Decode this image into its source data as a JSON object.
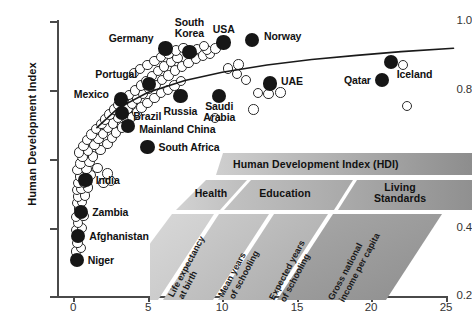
{
  "chart_data": {
    "type": "scatter",
    "title": "",
    "xlabel": "",
    "ylabel": "Human Development Index",
    "xlim": [
      -1.2,
      26
    ],
    "ylim": [
      0.2,
      1.02
    ],
    "xticks": [
      "0",
      "5",
      "10",
      "15",
      "20",
      "25"
    ],
    "xtick_values": [
      0,
      5,
      10,
      15,
      20,
      25
    ],
    "yticks": [
      "1.0",
      "0.8",
      "0.6",
      "0.4",
      "0.2"
    ],
    "ytick_values": [
      1.0,
      0.8,
      0.6,
      0.4,
      0.2
    ],
    "grid": false,
    "legend": "none",
    "series": [
      {
        "name": "Labelled countries",
        "marker": "filled circle",
        "color": "#161616",
        "points": [
          {
            "label": "Germany",
            "x": 6.2,
            "y": 0.92,
            "label_pos": "left"
          },
          {
            "label": "South Korea",
            "x": 7.8,
            "y": 0.909,
            "label_pos": "top"
          },
          {
            "label": "USA",
            "x": 10.1,
            "y": 0.937,
            "label_pos": "top"
          },
          {
            "label": "Norway",
            "x": 12.0,
            "y": 0.944,
            "label_pos": "right"
          },
          {
            "label": "Portugal",
            "x": 5.1,
            "y": 0.816,
            "label_pos": "left"
          },
          {
            "label": "Mexico",
            "x": 3.2,
            "y": 0.772,
            "label_pos": "left"
          },
          {
            "label": "Brazil",
            "x": 3.3,
            "y": 0.733,
            "label_pos": "right"
          },
          {
            "label": "Mainland China",
            "x": 3.7,
            "y": 0.694,
            "label_pos": "right"
          },
          {
            "label": "South Africa",
            "x": 5.0,
            "y": 0.634,
            "label_pos": "right"
          },
          {
            "label": "Russia",
            "x": 7.2,
            "y": 0.782,
            "label_pos": "bottom"
          },
          {
            "label": "Saudi Arabia",
            "x": 9.8,
            "y": 0.782,
            "label_pos": "bottom"
          },
          {
            "label": "UAE",
            "x": 13.2,
            "y": 0.818,
            "label_pos": "right"
          },
          {
            "label": "Qatar",
            "x": 20.7,
            "y": 0.829,
            "label_pos": "left"
          },
          {
            "label": "Iceland",
            "x": 21.3,
            "y": 0.88,
            "label_pos": "bottom"
          },
          {
            "label": "India",
            "x": 0.85,
            "y": 0.537,
            "label_pos": "right"
          },
          {
            "label": "Zambia",
            "x": 0.55,
            "y": 0.445,
            "label_pos": "right"
          },
          {
            "label": "Afghanistan",
            "x": 0.35,
            "y": 0.374,
            "label_pos": "right"
          },
          {
            "label": "Niger",
            "x": 0.25,
            "y": 0.305,
            "label_pos": "right"
          }
        ]
      },
      {
        "name": "Other countries",
        "marker": "open circle",
        "color": "#ffffff",
        "edge_color": "#2b2b2b",
        "points": [
          {
            "x": 0.2,
            "y": 0.33
          },
          {
            "x": 0.55,
            "y": 0.34
          },
          {
            "x": 0.3,
            "y": 0.355
          },
          {
            "x": 0.2,
            "y": 0.392
          },
          {
            "x": 0.6,
            "y": 0.398
          },
          {
            "x": 0.35,
            "y": 0.412
          },
          {
            "x": 0.22,
            "y": 0.43
          },
          {
            "x": 0.7,
            "y": 0.432
          },
          {
            "x": 0.4,
            "y": 0.455
          },
          {
            "x": 0.25,
            "y": 0.47
          },
          {
            "x": 0.62,
            "y": 0.474
          },
          {
            "x": 0.35,
            "y": 0.49
          },
          {
            "x": 0.82,
            "y": 0.492
          },
          {
            "x": 0.28,
            "y": 0.508
          },
          {
            "x": 0.58,
            "y": 0.512
          },
          {
            "x": 1.0,
            "y": 0.516
          },
          {
            "x": 0.38,
            "y": 0.528
          },
          {
            "x": 0.75,
            "y": 0.53
          },
          {
            "x": 2.05,
            "y": 0.528
          },
          {
            "x": 2.55,
            "y": 0.534
          },
          {
            "x": 0.45,
            "y": 0.548
          },
          {
            "x": 1.2,
            "y": 0.552
          },
          {
            "x": 2.3,
            "y": 0.556
          },
          {
            "x": 0.3,
            "y": 0.566
          },
          {
            "x": 0.9,
            "y": 0.57
          },
          {
            "x": 1.65,
            "y": 0.572
          },
          {
            "x": 0.5,
            "y": 0.585
          },
          {
            "x": 1.1,
            "y": 0.59
          },
          {
            "x": 0.65,
            "y": 0.604
          },
          {
            "x": 1.35,
            "y": 0.606
          },
          {
            "x": 0.4,
            "y": 0.618
          },
          {
            "x": 1.0,
            "y": 0.622
          },
          {
            "x": 1.85,
            "y": 0.624
          },
          {
            "x": 0.7,
            "y": 0.636
          },
          {
            "x": 1.45,
            "y": 0.64
          },
          {
            "x": 2.3,
            "y": 0.642
          },
          {
            "x": 0.95,
            "y": 0.654
          },
          {
            "x": 1.7,
            "y": 0.656
          },
          {
            "x": 2.6,
            "y": 0.66
          },
          {
            "x": 1.25,
            "y": 0.67
          },
          {
            "x": 2.0,
            "y": 0.672
          },
          {
            "x": 2.9,
            "y": 0.676
          },
          {
            "x": 1.55,
            "y": 0.686
          },
          {
            "x": 2.35,
            "y": 0.688
          },
          {
            "x": 3.3,
            "y": 0.69
          },
          {
            "x": 1.9,
            "y": 0.7
          },
          {
            "x": 2.7,
            "y": 0.702
          },
          {
            "x": 3.6,
            "y": 0.706
          },
          {
            "x": 2.15,
            "y": 0.714
          },
          {
            "x": 3.0,
            "y": 0.718
          },
          {
            "x": 3.95,
            "y": 0.72
          },
          {
            "x": 2.45,
            "y": 0.728
          },
          {
            "x": 3.35,
            "y": 0.732
          },
          {
            "x": 4.3,
            "y": 0.734
          },
          {
            "x": 2.75,
            "y": 0.742
          },
          {
            "x": 3.65,
            "y": 0.746
          },
          {
            "x": 4.6,
            "y": 0.748
          },
          {
            "x": 3.05,
            "y": 0.756
          },
          {
            "x": 3.95,
            "y": 0.76
          },
          {
            "x": 5.0,
            "y": 0.762
          },
          {
            "x": 3.4,
            "y": 0.77
          },
          {
            "x": 4.3,
            "y": 0.774
          },
          {
            "x": 5.45,
            "y": 0.776
          },
          {
            "x": 3.75,
            "y": 0.784
          },
          {
            "x": 4.7,
            "y": 0.788
          },
          {
            "x": 5.9,
            "y": 0.79
          },
          {
            "x": 4.15,
            "y": 0.798
          },
          {
            "x": 5.1,
            "y": 0.802
          },
          {
            "x": 6.35,
            "y": 0.8
          },
          {
            "x": 4.55,
            "y": 0.812
          },
          {
            "x": 5.55,
            "y": 0.814
          },
          {
            "x": 6.8,
            "y": 0.812
          },
          {
            "x": 4.9,
            "y": 0.826
          },
          {
            "x": 5.95,
            "y": 0.828
          },
          {
            "x": 7.25,
            "y": 0.826
          },
          {
            "x": 5.3,
            "y": 0.84
          },
          {
            "x": 6.4,
            "y": 0.842
          },
          {
            "x": 4.1,
            "y": 0.848
          },
          {
            "x": 5.7,
            "y": 0.854
          },
          {
            "x": 6.85,
            "y": 0.856
          },
          {
            "x": 4.5,
            "y": 0.86
          },
          {
            "x": 6.1,
            "y": 0.868
          },
          {
            "x": 7.3,
            "y": 0.868
          },
          {
            "x": 5.0,
            "y": 0.872
          },
          {
            "x": 6.55,
            "y": 0.88
          },
          {
            "x": 7.75,
            "y": 0.878
          },
          {
            "x": 5.45,
            "y": 0.884
          },
          {
            "x": 7.0,
            "y": 0.892
          },
          {
            "x": 8.25,
            "y": 0.89
          },
          {
            "x": 5.9,
            "y": 0.896
          },
          {
            "x": 8.7,
            "y": 0.9
          },
          {
            "x": 9.2,
            "y": 0.906
          },
          {
            "x": 6.4,
            "y": 0.906
          },
          {
            "x": 9.0,
            "y": 0.916
          },
          {
            "x": 9.55,
            "y": 0.92
          },
          {
            "x": 6.9,
            "y": 0.914
          },
          {
            "x": 7.4,
            "y": 0.922
          },
          {
            "x": 8.3,
            "y": 0.918
          },
          {
            "x": 8.8,
            "y": 0.928
          },
          {
            "x": 10.4,
            "y": 0.862
          },
          {
            "x": 11.0,
            "y": 0.845
          },
          {
            "x": 11.6,
            "y": 0.828
          },
          {
            "x": 11.1,
            "y": 0.874
          },
          {
            "x": 12.4,
            "y": 0.79
          },
          {
            "x": 13.1,
            "y": 0.788
          },
          {
            "x": 13.9,
            "y": 0.792
          },
          {
            "x": 22.1,
            "y": 0.872
          },
          {
            "x": 22.4,
            "y": 0.752
          },
          {
            "x": 9.5,
            "y": 0.718
          },
          {
            "x": 12.1,
            "y": 0.742
          }
        ]
      }
    ],
    "trend_curve": {
      "name": "fitted log trend",
      "color": "#1a1a1a",
      "points": [
        {
          "x": 1.6,
          "y": 0.69
        },
        {
          "x": 3.0,
          "y": 0.746
        },
        {
          "x": 5.0,
          "y": 0.792
        },
        {
          "x": 7.5,
          "y": 0.827
        },
        {
          "x": 10.0,
          "y": 0.851
        },
        {
          "x": 13.0,
          "y": 0.872
        },
        {
          "x": 16.0,
          "y": 0.888
        },
        {
          "x": 19.0,
          "y": 0.9
        },
        {
          "x": 22.0,
          "y": 0.911
        },
        {
          "x": 25.5,
          "y": 0.921
        }
      ]
    }
  },
  "inset": {
    "name": "hdi-composition-diagram",
    "title": "Human Development Index (HDI)",
    "pillars": [
      {
        "name": "Health",
        "label": "Health"
      },
      {
        "name": "Education",
        "label": "Education"
      },
      {
        "name": "Living Standards",
        "label": "Living\nStandards"
      }
    ],
    "pillar_labels": {
      "health": "Health",
      "education": "Education",
      "living_standards_line1": "Living",
      "living_standards_line2": "Standards"
    },
    "indicators": [
      {
        "line1": "Life expectancy",
        "line2": "at birth"
      },
      {
        "line1": "Mean years",
        "line2": "of schooling"
      },
      {
        "line1": "Expected years",
        "line2": "of schooling"
      },
      {
        "line1": "Gross national",
        "line2": "income per capita"
      }
    ],
    "colors": {
      "banner_light": "#c9c9c9",
      "banner_dark": "#8f8f8f",
      "pillar_light": "#cfcfcf",
      "pillar_mid": "#b4b4b4",
      "pillar_dark": "#9a9a9a",
      "indicator_light": "#d6d6d6",
      "indicator_dark": "#a3a3a3"
    }
  },
  "colors": {
    "highlight_marker": "#161616",
    "other_marker_edge": "#2b2b2b",
    "axis": "#4a4a4a",
    "text": "#111111"
  }
}
